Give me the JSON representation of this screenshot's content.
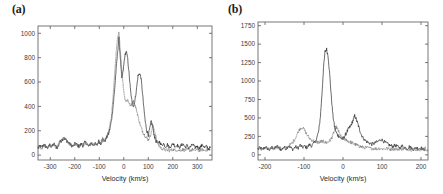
{
  "figure": {
    "background": "#ffffff",
    "panel_label_a": "(a)",
    "panel_label_b": "(b)"
  },
  "chart_data": [
    {
      "panel": "(a)",
      "type": "line",
      "title": "",
      "xlabel": "Velocity (km/s)",
      "ylabel": "",
      "xlim": [
        -350,
        360
      ],
      "ylim": [
        -40,
        1060
      ],
      "xticks": [
        -300,
        -200,
        -100,
        0,
        100,
        200,
        300
      ],
      "xticklabels": [
        "-300",
        "-200",
        "-100",
        "0",
        "100",
        "200",
        "300"
      ],
      "yticks": [
        0,
        200,
        400,
        600,
        800,
        1000
      ],
      "yticklabels": [
        "0",
        "200",
        "400",
        "600",
        "800",
        "1000"
      ],
      "grid": false,
      "legend": "none",
      "series": [
        {
          "name": "solid-trace",
          "style": "solid",
          "color": "#1d1d1d",
          "x": [
            -350,
            -342,
            -334,
            -326,
            -318,
            -310,
            -302,
            -294,
            -286,
            -278,
            -270,
            -262,
            -254,
            -246,
            -238,
            -230,
            -222,
            -214,
            -206,
            -198,
            -190,
            -182,
            -174,
            -166,
            -158,
            -150,
            -142,
            -134,
            -126,
            -118,
            -110,
            -102,
            -94,
            -86,
            -78,
            -70,
            -62,
            -56,
            -50,
            -44,
            -38,
            -32,
            -26,
            -20,
            -14,
            -8,
            -2,
            4,
            10,
            16,
            22,
            28,
            34,
            40,
            46,
            52,
            58,
            64,
            70,
            76,
            82,
            88,
            94,
            100,
            106,
            112,
            118,
            124,
            130,
            138,
            146,
            154,
            162,
            170,
            178,
            186,
            194,
            202,
            210,
            218,
            226,
            234,
            242,
            250,
            258,
            266,
            274,
            282,
            290,
            298,
            306,
            314,
            322,
            330,
            338,
            346,
            354
          ],
          "y": [
            55,
            78,
            62,
            90,
            70,
            58,
            85,
            66,
            95,
            72,
            60,
            105,
            120,
            138,
            128,
            112,
            95,
            80,
            72,
            98,
            85,
            68,
            92,
            76,
            110,
            88,
            70,
            100,
            82,
            95,
            78,
            115,
            95,
            130,
            110,
            145,
            175,
            220,
            290,
            395,
            520,
            680,
            830,
            960,
            800,
            620,
            700,
            810,
            855,
            790,
            660,
            520,
            430,
            400,
            455,
            545,
            650,
            672,
            640,
            520,
            380,
            270,
            200,
            165,
            215,
            280,
            230,
            165,
            120,
            95,
            110,
            80,
            95,
            70,
            88,
            62,
            80,
            95,
            70,
            85,
            60,
            78,
            92,
            65,
            80,
            58,
            72,
            88,
            62,
            75,
            55,
            70,
            85,
            60,
            72,
            50,
            64
          ]
        },
        {
          "name": "dashed-trace",
          "style": "dashed",
          "color": "#6d6d6d",
          "x": [
            -350,
            -342,
            -334,
            -326,
            -318,
            -310,
            -302,
            -294,
            -286,
            -278,
            -270,
            -262,
            -254,
            -246,
            -238,
            -230,
            -222,
            -214,
            -206,
            -198,
            -190,
            -182,
            -174,
            -166,
            -158,
            -150,
            -142,
            -134,
            -126,
            -118,
            -110,
            -102,
            -94,
            -86,
            -78,
            -70,
            -62,
            -56,
            -50,
            -44,
            -38,
            -32,
            -26,
            -20,
            -14,
            -8,
            -2,
            4,
            10,
            16,
            22,
            28,
            34,
            40,
            46,
            52,
            58,
            64,
            70,
            76,
            82,
            88,
            94,
            100,
            106,
            112,
            118,
            124,
            130,
            138,
            146,
            154,
            162,
            170,
            178,
            186,
            194,
            202,
            210,
            218,
            226,
            234,
            242,
            250,
            258,
            266,
            274,
            282,
            290,
            298,
            306,
            314,
            322,
            330,
            338,
            346,
            354
          ],
          "y": [
            62,
            70,
            55,
            82,
            74,
            65,
            78,
            70,
            88,
            68,
            72,
            110,
            125,
            142,
            130,
            108,
            90,
            78,
            82,
            92,
            78,
            72,
            86,
            80,
            102,
            92,
            76,
            95,
            88,
            90,
            86,
            120,
            100,
            135,
            118,
            150,
            190,
            250,
            330,
            470,
            640,
            820,
            945,
            1000,
            860,
            700,
            560,
            470,
            440,
            455,
            430,
            400,
            430,
            440,
            410,
            370,
            320,
            270,
            230,
            200,
            175,
            155,
            140,
            125,
            150,
            185,
            240,
            215,
            160,
            100,
            70,
            55,
            48,
            42,
            40,
            38,
            42,
            45,
            40,
            44,
            38,
            42,
            46,
            40,
            44,
            38,
            42,
            46,
            40,
            44,
            38,
            42,
            46,
            40,
            44,
            38,
            42
          ]
        }
      ]
    },
    {
      "panel": "(b)",
      "type": "line",
      "title": "",
      "xlabel": "Velocity (km/s)",
      "ylabel": "",
      "xlim": [
        -218,
        218
      ],
      "ylim": [
        -70,
        1800
      ],
      "xticks": [
        -200,
        -100,
        0,
        100,
        200
      ],
      "xticklabels": [
        "-200",
        "-100",
        "0",
        "100",
        "200"
      ],
      "yticks": [
        0,
        250,
        500,
        750,
        1000,
        1250,
        1500,
        1750
      ],
      "yticklabels": [
        "0",
        "250",
        "500",
        "750",
        "1000",
        "1250",
        "1500",
        "1750"
      ],
      "grid": false,
      "legend": "none",
      "series": [
        {
          "name": "solid-trace",
          "style": "solid",
          "color": "#1d1d1d",
          "x": [
            -218,
            -212,
            -206,
            -200,
            -194,
            -188,
            -182,
            -176,
            -170,
            -164,
            -158,
            -152,
            -146,
            -140,
            -134,
            -128,
            -122,
            -116,
            -110,
            -104,
            -98,
            -92,
            -86,
            -80,
            -74,
            -68,
            -62,
            -58,
            -54,
            -50,
            -46,
            -42,
            -38,
            -34,
            -30,
            -26,
            -22,
            -18,
            -14,
            -10,
            -6,
            -2,
            2,
            6,
            10,
            14,
            18,
            22,
            26,
            30,
            34,
            38,
            42,
            46,
            50,
            56,
            62,
            68,
            74,
            80,
            86,
            92,
            98,
            104,
            110,
            116,
            122,
            128,
            134,
            140,
            146,
            152,
            158,
            164,
            170,
            176,
            182,
            188,
            194,
            200,
            206,
            212,
            218
          ],
          "y": [
            80,
            95,
            70,
            110,
            85,
            65,
            100,
            78,
            120,
            90,
            68,
            105,
            82,
            125,
            95,
            72,
            110,
            88,
            130,
            100,
            115,
            95,
            140,
            120,
            160,
            210,
            330,
            520,
            820,
            1180,
            1400,
            1430,
            1330,
            1080,
            790,
            540,
            390,
            310,
            270,
            250,
            230,
            215,
            230,
            270,
            310,
            350,
            380,
            420,
            470,
            530,
            480,
            420,
            350,
            290,
            240,
            200,
            175,
            160,
            145,
            155,
            170,
            190,
            210,
            185,
            160,
            140,
            125,
            115,
            130,
            110,
            95,
            120,
            100,
            85,
            110,
            90,
            75,
            100,
            80,
            95,
            70,
            88
          ]
        },
        {
          "name": "dashed-trace",
          "style": "dashed",
          "color": "#6d6d6d",
          "x": [
            -218,
            -212,
            -206,
            -200,
            -194,
            -188,
            -182,
            -176,
            -170,
            -164,
            -158,
            -152,
            -146,
            -140,
            -134,
            -128,
            -122,
            -116,
            -110,
            -104,
            -98,
            -92,
            -86,
            -80,
            -74,
            -68,
            -62,
            -58,
            -54,
            -50,
            -46,
            -42,
            -38,
            -34,
            -30,
            -26,
            -22,
            -18,
            -14,
            -10,
            -6,
            -2,
            2,
            6,
            10,
            14,
            18,
            22,
            26,
            30,
            34,
            38,
            42,
            46,
            50,
            56,
            62,
            68,
            74,
            80,
            86,
            92,
            98,
            104,
            110,
            116,
            122,
            128,
            134,
            140,
            146,
            152,
            158,
            164,
            170,
            176,
            182,
            188,
            194,
            200,
            206,
            212,
            218
          ],
          "y": [
            75,
            88,
            65,
            100,
            80,
            70,
            95,
            85,
            110,
            95,
            80,
            100,
            90,
            120,
            140,
            175,
            230,
            300,
            360,
            370,
            330,
            270,
            225,
            200,
            185,
            175,
            170,
            175,
            185,
            180,
            170,
            165,
            175,
            190,
            220,
            265,
            330,
            380,
            350,
            300,
            255,
            225,
            215,
            205,
            195,
            185,
            175,
            165,
            155,
            145,
            135,
            125,
            118,
            110,
            105,
            98,
            95,
            90,
            88,
            85,
            82,
            88,
            84,
            80,
            86,
            82,
            78,
            84,
            80,
            76,
            82,
            78,
            74,
            80,
            76,
            72,
            78,
            74,
            70,
            76,
            72,
            68,
            74
          ]
        }
      ]
    }
  ]
}
